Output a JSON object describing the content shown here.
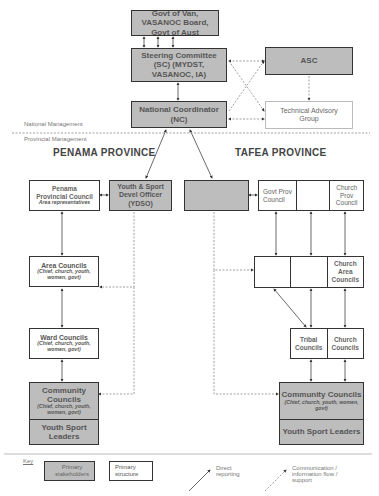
{
  "nodes": {
    "govt": "Govt of Van, VASANOC Board, Govt of Aust",
    "sc": "Steering Committee (SC) (MYDST, VASANOC, IA)",
    "asc": "ASC",
    "nc_line1": "National Coordinator",
    "nc_line2": "(NC)",
    "tag": "Technical Advisory Group",
    "penama_council_line1": "Penama",
    "penama_council_line2": "Provincial Council",
    "penama_council_sub": "Area representatives",
    "ydso": "Youth & Sport Devel Officer (YDSO)",
    "tafea_blank": "",
    "govt_prov_council": "Govt Prov Council",
    "tafea_prov_blank": "",
    "church_prov_council": "Church Prov Council",
    "area_councils": "Area Councils",
    "area_councils_sub": "(Chief, church, youth, women, govt)",
    "tafea_area_blank1": "",
    "tafea_area_blank2": "",
    "church_area_councils": "Church Area Councils",
    "ward_councils": "Ward Councils",
    "ward_councils_sub": "(Chief, church, youth, women, govt)",
    "tribal_councils": "Tribal Councils",
    "church_councils": "Church Councils",
    "community_councils": "Community Councils",
    "community_councils_sub": "(Chief, church, youth, women, govt)",
    "youth_sport_leaders": "Youth Sport Leaders"
  },
  "labels": {
    "national_management": "National Management",
    "provincial_management": "Provincial Management",
    "penama_province": "PENAMA  PROVINCE",
    "tafea_province": "TAFEA  PROVINCE"
  },
  "key": {
    "title": "Key",
    "primary_stakeholders": "Primary stakeholders",
    "primary_structure": "Primary structure",
    "direct_reporting": "Direct reporting",
    "communication": "Communication / information flow / support"
  },
  "colors": {
    "stakeholder_fill": "#bdbdbd",
    "border": "#333333",
    "dotted": "#888888"
  }
}
